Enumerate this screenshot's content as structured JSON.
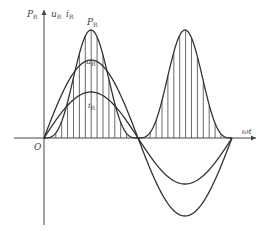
{
  "diagram": {
    "title": "",
    "labels": {
      "y_axis_power": "P",
      "y_axis_power_sub": "R",
      "y_axis_voltage": "u",
      "y_axis_voltage_sub": "R",
      "y_axis_current": "i",
      "y_axis_current_sub": "R",
      "curve_power": "P",
      "curve_power_sub": "R",
      "curve_voltage": "u",
      "curve_voltage_sub": "R",
      "curve_current": "i",
      "curve_current_sub": "R",
      "origin": "O",
      "x_axis": "ωt"
    },
    "geometry": {
      "origin": [
        44,
        138
      ],
      "half_period_px": 94,
      "power_amplitude_px": 108,
      "voltage_amplitude_px": 78,
      "current_amplitude_px": 46
    },
    "colors": {
      "stroke": "#333333",
      "background": "#ffffff"
    }
  }
}
